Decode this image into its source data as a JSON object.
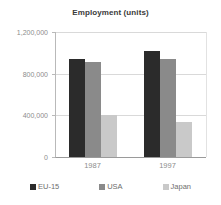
{
  "chart_data": {
    "type": "bar",
    "title": "Employment (units)",
    "xlabel": "",
    "ylabel": "",
    "categories": [
      "1987",
      "1997"
    ],
    "series": [
      {
        "name": "EU-15",
        "color": "#2b2b2b",
        "values": [
          940000,
          1020000
        ]
      },
      {
        "name": "USA",
        "color": "#8a8a8a",
        "values": [
          910000,
          940000
        ]
      },
      {
        "name": "Japan",
        "color": "#c9c9c9",
        "values": [
          400000,
          340000
        ]
      }
    ],
    "ylim": [
      0,
      1200000
    ],
    "yticks": [
      0,
      400000,
      800000,
      1200000
    ],
    "ytick_labels": [
      "0",
      "400,000",
      "800,000",
      "1,200,000"
    ],
    "grid": true,
    "legend_position": "bottom"
  },
  "legend": {
    "items": [
      {
        "label": "EU-15"
      },
      {
        "label": "USA"
      },
      {
        "label": "Japan"
      }
    ]
  }
}
